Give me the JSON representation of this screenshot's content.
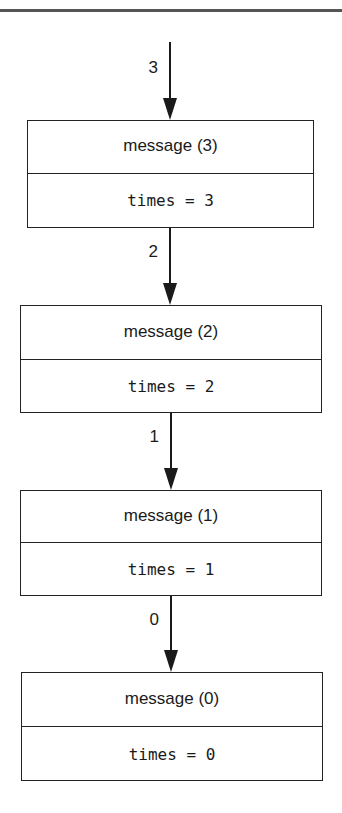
{
  "diagram": {
    "type": "stack-diagram",
    "colors": {
      "stroke": "#222222",
      "text": "#1a1a1a",
      "top_rule": "#555555",
      "background": "#ffffff"
    },
    "frames": [
      {
        "title": "message (3)",
        "variable": "times = 3"
      },
      {
        "title": "message (2)",
        "variable": "times = 2"
      },
      {
        "title": "message (1)",
        "variable": "times = 1"
      },
      {
        "title": "message (0)",
        "variable": "times = 0"
      }
    ],
    "arrows": [
      {
        "label": "3",
        "target": "message (3)"
      },
      {
        "label": "2",
        "target": "message (2)"
      },
      {
        "label": "1",
        "target": "message (1)"
      },
      {
        "label": "0",
        "target": "message (0)"
      }
    ]
  }
}
